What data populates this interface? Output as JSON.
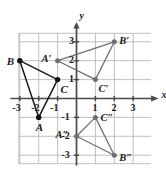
{
  "figure": {
    "type": "coordinate-plane-triangles",
    "axis_labels": {
      "x": "x",
      "y": "y"
    },
    "x_ticks": [
      "-3",
      "-2",
      "-1",
      "1",
      "2",
      "3"
    ],
    "y_ticks": [
      "3",
      "2",
      "1",
      "-1",
      "-2",
      "-3"
    ],
    "grid": true,
    "xlim": [
      -4,
      4
    ],
    "ylim": [
      -3.5,
      3.5
    ],
    "colors": {
      "grid": "#b9b9bd",
      "axis": "#4a4a4a",
      "triangle_original": "#1a1a1a",
      "triangle_image": "#6e6e74",
      "point_original": "#111111",
      "point_image": "#6e6e74",
      "text": "#1a1a1a"
    },
    "triangles": [
      {
        "name": "ABC",
        "style": "original",
        "vertices": [
          {
            "label": "A",
            "x": -2,
            "y": -1,
            "label_dx": -3,
            "label_dy": 11
          },
          {
            "label": "B",
            "x": -3,
            "y": 2,
            "label_dx": -13,
            "label_dy": 2
          },
          {
            "label": "C",
            "x": -1,
            "y": 1,
            "label_dx": 3,
            "label_dy": 11
          }
        ]
      },
      {
        "name": "A'B'C'",
        "style": "image",
        "vertices": [
          {
            "label": "A′",
            "x": -1,
            "y": 2,
            "label_dx": -16,
            "label_dy": 0
          },
          {
            "label": "B′",
            "x": 2,
            "y": 3,
            "label_dx": 5,
            "label_dy": 1
          },
          {
            "label": "C′",
            "x": 1,
            "y": 1,
            "label_dx": 3,
            "label_dy": 11
          }
        ]
      },
      {
        "name": "A''B''C''",
        "style": "image",
        "vertices": [
          {
            "label": "A″",
            "x": 0,
            "y": -2,
            "label_dx": -21,
            "label_dy": 0
          },
          {
            "label": "B″",
            "x": 2,
            "y": -3,
            "label_dx": 5,
            "label_dy": 4
          },
          {
            "label": "C″",
            "x": 1,
            "y": -1,
            "label_dx": 5,
            "label_dy": 2
          }
        ]
      }
    ]
  }
}
